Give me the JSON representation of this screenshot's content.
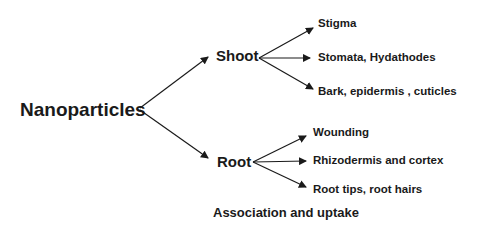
{
  "diagram": {
    "root": {
      "label": "Nanoparticles"
    },
    "branches": [
      {
        "label": "Shoot",
        "children": [
          "Stigma",
          "Stomata, Hydathodes",
          "Bark, epidermis , cuticles"
        ]
      },
      {
        "label": "Root",
        "children": [
          "Wounding",
          "Rhizodermis and cortex",
          "Root tips, root hairs"
        ]
      }
    ],
    "caption": "Association and  uptake",
    "colors": {
      "text": "#1a1a1a",
      "arrow": "#1a1a1a",
      "background": "#ffffff"
    }
  }
}
